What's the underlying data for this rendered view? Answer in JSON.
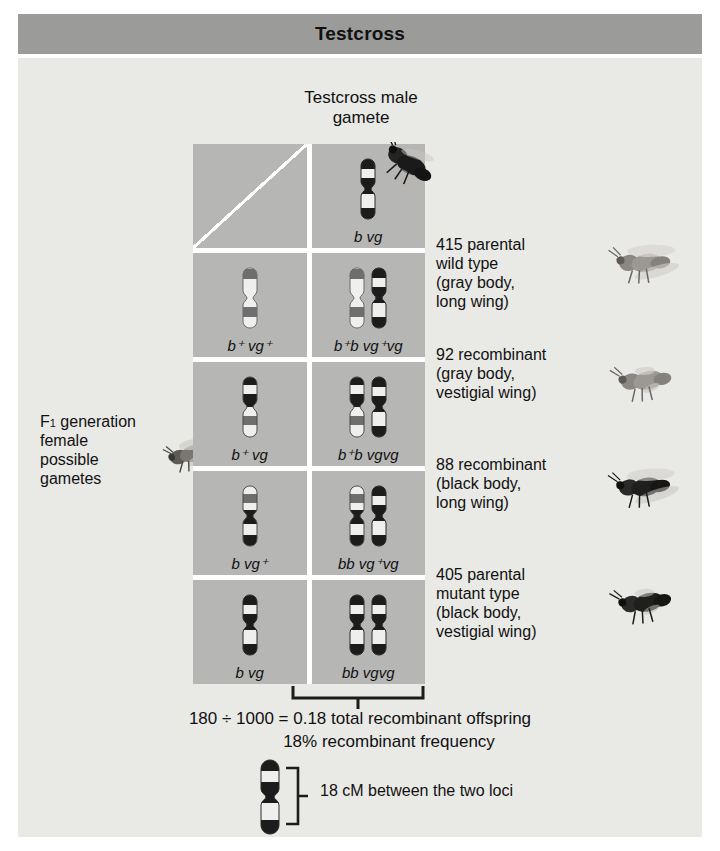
{
  "header": {
    "title": "Testcross"
  },
  "top_caption": {
    "line1": "Testcross male",
    "line2": "gamete"
  },
  "left_label": {
    "line1_pre": "F",
    "line1_sub": "1",
    "line1_post": " generation",
    "line2": "female",
    "line3": "possible",
    "line4": "gametes"
  },
  "grid": {
    "corner_genotype": "",
    "male_gamete": {
      "b": "b",
      "vg": "vg",
      "label": "b vg"
    },
    "rows": [
      {
        "female_gamete_label": "b⁺ vg⁺",
        "female_b": "b",
        "female_b_sup": "+",
        "female_vg": "vg",
        "female_vg_sup": "+",
        "offspring_label": "b⁺b vg⁺vg",
        "off_p1": "b",
        "off_p1_sup": "+",
        "off_p2": "b",
        "off_p3": "vg",
        "off_p3_sup": "+",
        "off_p4": "vg"
      },
      {
        "female_gamete_label": "b⁺ vg",
        "female_b": "b",
        "female_b_sup": "+",
        "female_vg": "vg",
        "female_vg_sup": "",
        "offspring_label": "b⁺b vgvg",
        "off_p1": "b",
        "off_p1_sup": "+",
        "off_p2": "b",
        "off_p3": "vg",
        "off_p3_sup": "",
        "off_p4": "vg"
      },
      {
        "female_gamete_label": "b vg⁺",
        "female_b": "b",
        "female_b_sup": "",
        "female_vg": "vg",
        "female_vg_sup": "+",
        "offspring_label": "bb vg⁺vg",
        "off_p1": "b",
        "off_p1_sup": "",
        "off_p2": "b",
        "off_p3": "vg",
        "off_p3_sup": "+",
        "off_p4": "vg"
      },
      {
        "female_gamete_label": "b vg",
        "female_b": "b",
        "female_b_sup": "",
        "female_vg": "vg",
        "female_vg_sup": "",
        "offspring_label": "bb vgvg",
        "off_p1": "b",
        "off_p1_sup": "",
        "off_p2": "b",
        "off_p3": "vg",
        "off_p3_sup": "",
        "off_p4": "vg"
      }
    ]
  },
  "annotations": [
    {
      "count": "415",
      "l1": "415 parental",
      "l2": "wild type",
      "l3": "(gray body,",
      "l4": "long wing)"
    },
    {
      "count": "92",
      "l1": "92 recombinant",
      "l2": "(gray body,",
      "l3": "vestigial wing)",
      "l4": ""
    },
    {
      "count": "88",
      "l1": "88 recombinant",
      "l2": "(black body,",
      "l3": "long wing)",
      "l4": ""
    },
    {
      "count": "405",
      "l1": "405 parental",
      "l2": "mutant type",
      "l3": "(black body,",
      "l4": "vestigial wing)"
    }
  ],
  "math": {
    "line1": "180 ÷ 1000 = 0.18 total recombinant offspring",
    "line2": "18% recombinant frequency"
  },
  "map_distance": {
    "text": "18 cM between the two loci"
  },
  "colors": {
    "header_bar": "#9b9b99",
    "panel": "#e9e9e6",
    "cell": "#b6b6b4",
    "gridline": "#ffffff",
    "text": "#111111",
    "chrom_dark": "#1c1c1c",
    "chrom_mid": "#6e6e6e",
    "chrom_light": "#efefee"
  }
}
